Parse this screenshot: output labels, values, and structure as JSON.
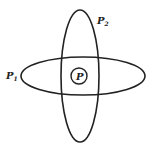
{
  "diagram": {
    "shapes": [
      {
        "id": "horizontal-ellipse",
        "cx": 83,
        "cy": 76,
        "rx": 62,
        "ry": 19
      },
      {
        "id": "vertical-ellipse",
        "cx": 80,
        "cy": 76,
        "rx": 19,
        "ry": 66
      },
      {
        "id": "center-circle",
        "cx": 79,
        "cy": 76,
        "r": 8
      }
    ],
    "labels": {
      "p2": {
        "base": "P",
        "sub": "2"
      },
      "p1": {
        "base": "P",
        "sub": "1"
      },
      "p": {
        "base": "P"
      }
    },
    "colors": {
      "stroke": "#222222",
      "background": "#ffffff"
    }
  }
}
